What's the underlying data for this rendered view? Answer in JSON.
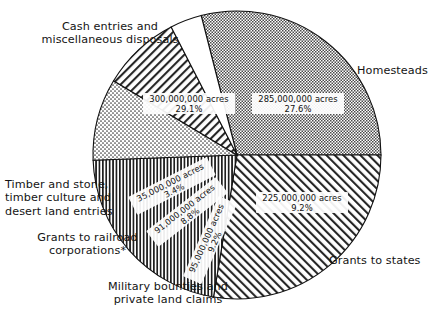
{
  "chart_data": {
    "type": "pie",
    "title": "",
    "subtitle": "",
    "unit": "acres",
    "legend_position": "outside-callouts",
    "grid": false,
    "total_value": 1031000000,
    "categories": [
      "Cash entries and miscellaneous disposals",
      "Homesteads",
      "Grants to states",
      "Military bounties and private land claims",
      "Grants to railroad corporations*",
      "Timber and stone, timber culture and desert land entries"
    ],
    "values": [
      300000000,
      285000000,
      225000000,
      95000000,
      91000000,
      35000000
    ],
    "percentages": [
      29.1,
      27.6,
      21.8,
      9.2,
      8.8,
      3.4
    ],
    "slices": [
      {
        "id": "cash-entries",
        "label": "Cash entries and\nmiscellaneous disposals",
        "value": 300000000,
        "value_label": "300,000,000 acres",
        "percent": 29.1,
        "percent_label": "29.1%",
        "fill_pattern": "checker",
        "start_angle_deg": 255.6,
        "end_angle_deg": 360.0
      },
      {
        "id": "homesteads",
        "label": "Homesteads",
        "value": 285000000,
        "value_label": "285,000,000 acres",
        "percent": 27.6,
        "percent_label": "27.6%",
        "fill_pattern": "diagonal-up",
        "start_angle_deg": 0.0,
        "end_angle_deg": 99.4
      },
      {
        "id": "grants-to-states",
        "label": "Grants to states",
        "value": 225000000,
        "value_label": "225,000,000 acres",
        "percent": 21.8,
        "percent_label": "21.8%",
        "fill_pattern": "vertical-lines",
        "start_angle_deg": 99.4,
        "end_angle_deg": 177.9
      },
      {
        "id": "military-bounties",
        "label": "Military bounties and\nprivate land claims",
        "value": 95000000,
        "value_label": "95,000,000 acres",
        "percent": 9.2,
        "percent_label": "9.2%",
        "fill_pattern": "stipple",
        "start_angle_deg": 177.9,
        "end_angle_deg": 211.0
      },
      {
        "id": "railroad-grants",
        "label": "Grants to railroad\ncorporations*",
        "value": 91000000,
        "value_label": "91,000,000 acres",
        "percent": 8.8,
        "percent_label": "8.8%",
        "fill_pattern": "diagonal-down",
        "start_angle_deg": 211.0,
        "end_angle_deg": 242.8
      },
      {
        "id": "timber-stone",
        "label": "Timber and stone,\ntimber culture and\ndesert land entries",
        "value": 35000000,
        "value_label": "35,000,000 acres",
        "percent": 3.4,
        "percent_label": "3.4%",
        "fill_pattern": "blank",
        "start_angle_deg": 242.8,
        "end_angle_deg": 255.6
      }
    ],
    "colors": {
      "outline": "#111111",
      "pattern_ink": "#2b2b2b",
      "background": "#ffffff",
      "text": "#141414"
    }
  }
}
